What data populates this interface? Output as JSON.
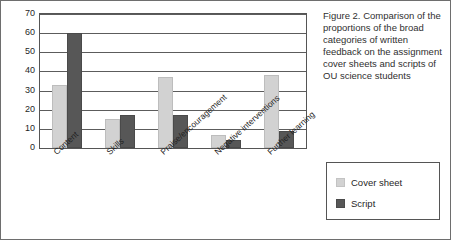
{
  "caption": "Figure 2. Comparison of the proportions of the broad categories of written feedback on the assignment cover sheets and scripts of OU science students",
  "legend": {
    "items": [
      {
        "label": "Cover sheet",
        "color": "#d2d2d2"
      },
      {
        "label": "Script",
        "color": "#575757"
      }
    ]
  },
  "chart_data": {
    "type": "bar",
    "title": "",
    "xlabel": "",
    "ylabel": "",
    "ylim": [
      0,
      70
    ],
    "ytick_step": 10,
    "yticks": [
      "70",
      "60",
      "50",
      "40",
      "30",
      "20",
      "10",
      "0"
    ],
    "grid": true,
    "legend_position": "bottom-right-outside",
    "categories": [
      "Content",
      "Skills",
      "Praise/encouragement",
      "Negative interventions",
      "Further learning"
    ],
    "series": [
      {
        "name": "Cover sheet",
        "color": "#d2d2d2",
        "values": [
          33,
          15,
          37,
          7,
          38
        ]
      },
      {
        "name": "Script",
        "color": "#575757",
        "values": [
          60,
          17,
          17,
          4,
          9
        ]
      }
    ]
  }
}
